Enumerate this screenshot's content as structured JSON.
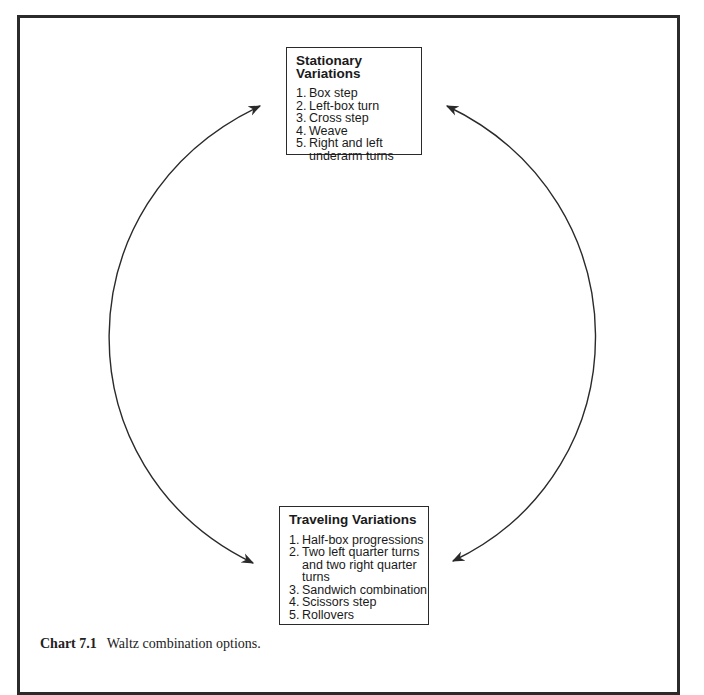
{
  "header_fragment": "",
  "diagram": {
    "top_box": {
      "title": "Stationary Variations",
      "items": [
        {
          "num": "1.",
          "text": "Box step"
        },
        {
          "num": "2.",
          "text": "Left-box turn"
        },
        {
          "num": "3.",
          "text": "Cross step"
        },
        {
          "num": "4.",
          "text": "Weave"
        },
        {
          "num": "5.",
          "text": "Right and left underarm turns"
        }
      ]
    },
    "bottom_box": {
      "title": "Traveling Variations",
      "items": [
        {
          "num": "1.",
          "text": "Half-box progressions"
        },
        {
          "num": "2.",
          "text": "Two left quarter turns and two right quarter turns"
        },
        {
          "num": "3.",
          "text": "Sandwich combination"
        },
        {
          "num": "4.",
          "text": "Scissors step"
        },
        {
          "num": "5.",
          "text": "Rollovers"
        }
      ]
    },
    "arrows": [
      {
        "name": "left-arc",
        "direction": "bidirectional",
        "from": "bottom_box",
        "to": "top_box"
      },
      {
        "name": "right-arc",
        "direction": "bidirectional",
        "from": "top_box",
        "to": "bottom_box"
      }
    ],
    "line_color": "#2a2a2a"
  },
  "caption": {
    "label": "Chart 7.1",
    "text": "Waltz combination options."
  }
}
